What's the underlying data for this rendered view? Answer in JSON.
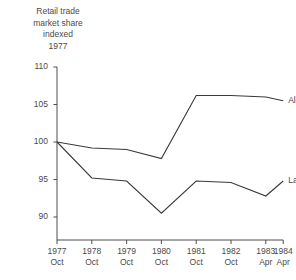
{
  "chart_data": {
    "type": "line",
    "title": "Retail trade\nmarket share\nindexed\n1977",
    "xlabel": "",
    "ylabel": "",
    "ylim": [
      88,
      110
    ],
    "yticks": [
      110,
      105,
      100,
      95,
      90
    ],
    "ytick_labels": [
      "110",
      "105",
      "100",
      "95",
      "90"
    ],
    "grid": false,
    "legend_position": "right-inline",
    "x_positions": [
      0,
      1,
      2,
      3,
      4,
      5,
      6,
      6.5
    ],
    "categories": [
      "1977 Oct",
      "1978 Oct",
      "1979 Oct",
      "1980 Oct",
      "1981 Oct",
      "1982 Oct",
      "1983 Apr",
      "1984 Apr"
    ],
    "xtick_labels": [
      {
        "year": "1977",
        "month": "Oct"
      },
      {
        "year": "1978",
        "month": "Oct"
      },
      {
        "year": "1979",
        "month": "Oct"
      },
      {
        "year": "1980",
        "month": "Oct"
      },
      {
        "year": "1981",
        "month": "Oct"
      },
      {
        "year": "1982",
        "month": "Oct"
      },
      {
        "year": "1983",
        "month": "Apr"
      },
      {
        "year": "1984",
        "month": "Apr"
      }
    ],
    "series": [
      {
        "name": "Ales",
        "color": "#3a3a3a",
        "values": [
          100,
          99.2,
          99,
          97.8,
          106.2,
          106.2,
          106,
          105.5
        ]
      },
      {
        "name": "Lagers",
        "color": "#3a3a3a",
        "values": [
          100,
          95.2,
          94.8,
          90.5,
          94.8,
          94.6,
          92.8,
          94.8
        ]
      }
    ]
  },
  "colors": {
    "axis": "#4d4d4d",
    "text": "#4a4a4a",
    "line": "#3a3a3a",
    "background": "#ffffff"
  }
}
